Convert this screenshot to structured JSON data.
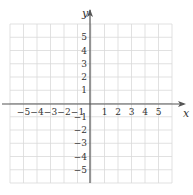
{
  "chart_data": {
    "type": "scatter",
    "title": "",
    "xlabel": "x",
    "ylabel": "y",
    "xlim": [
      -6,
      6
    ],
    "ylim": [
      -6,
      6
    ],
    "grid": true,
    "x_ticks": [
      -5,
      -4,
      -3,
      -2,
      -1,
      1,
      2,
      3,
      4,
      5
    ],
    "y_ticks": [
      5,
      4,
      3,
      2,
      1,
      -1,
      -2,
      -3,
      -4,
      -5
    ],
    "x_tick_labels": [
      "−5",
      "−4",
      "−3",
      "−2",
      "−1",
      "1",
      "2",
      "3",
      "4",
      "5"
    ],
    "y_tick_labels": [
      "5",
      "4",
      "3",
      "2",
      "1",
      "−1",
      "−2",
      "−3",
      "−4",
      "−5"
    ],
    "series": []
  },
  "colors": {
    "grid": "#d9d9d9",
    "axis": "#555555",
    "text": "#333333"
  }
}
